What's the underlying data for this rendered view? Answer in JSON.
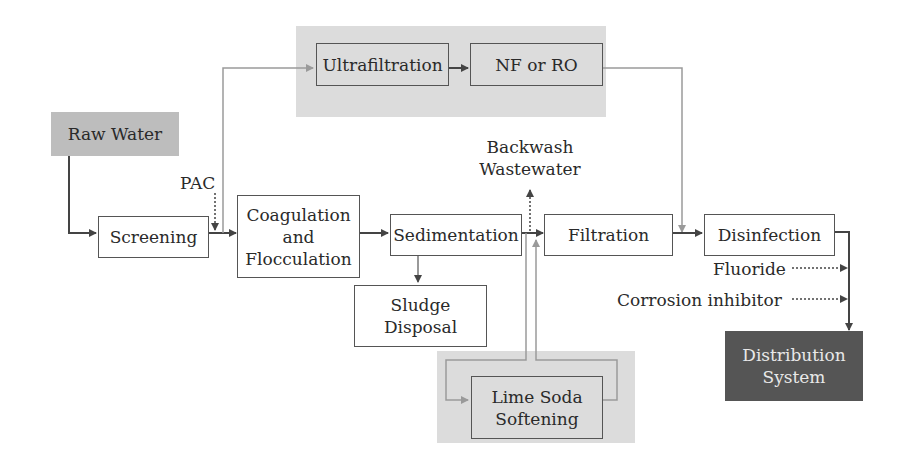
{
  "diagram": {
    "nodes": {
      "raw_water": "Raw Water",
      "screening": "Screening",
      "coagulation_line1": "Coagulation",
      "coagulation_line2": "and",
      "coagulation_line3": "Flocculation",
      "sedimentation": "Sedimentation",
      "filtration": "Filtration",
      "disinfection": "Disinfection",
      "ultrafiltration": "Ultrafiltration",
      "nf_ro": "NF or RO",
      "sludge_line1": "Sludge",
      "sludge_line2": "Disposal",
      "lime_line1": "Lime Soda",
      "lime_line2": "Softening",
      "distribution_line1": "Distribution",
      "distribution_line2": "System"
    },
    "labels": {
      "pac": "PAC",
      "backwash_line1": "Backwash",
      "backwash_line2": "Wastewater",
      "fluoride": "Fluoride",
      "corrosion": "Corrosion inhibitor"
    },
    "colors": {
      "panel": "#dcdcdc",
      "raw_water_fill": "#bdbdbd",
      "distribution_fill": "#555555",
      "main_line": "#444444",
      "bypass_line": "#9a9a9a"
    },
    "edges": [
      {
        "from": "Raw Water",
        "to": "Screening"
      },
      {
        "from": "Screening",
        "to": "Coagulation and Flocculation"
      },
      {
        "from": "PAC",
        "to": "Screening-Coagulation junction",
        "style": "dotted"
      },
      {
        "from": "Screening-Coagulation junction",
        "to": "Ultrafiltration",
        "style": "bypass"
      },
      {
        "from": "Ultrafiltration",
        "to": "NF or RO"
      },
      {
        "from": "NF or RO",
        "to": "Filtration-Disinfection junction",
        "style": "bypass"
      },
      {
        "from": "Coagulation and Flocculation",
        "to": "Sedimentation"
      },
      {
        "from": "Sedimentation",
        "to": "Sludge Disposal"
      },
      {
        "from": "Sedimentation",
        "to": "Filtration"
      },
      {
        "from": "Sedimentation-Filtration junction",
        "to": "Backwash Wastewater",
        "style": "dotted"
      },
      {
        "from": "Sedimentation-Filtration junction",
        "to": "Lime Soda Softening",
        "style": "bypass"
      },
      {
        "from": "Lime Soda Softening",
        "to": "Sedimentation-Filtration junction",
        "style": "bypass"
      },
      {
        "from": "Filtration",
        "to": "Disinfection"
      },
      {
        "from": "Fluoride",
        "to": "Distribution line",
        "style": "dotted"
      },
      {
        "from": "Corrosion inhibitor",
        "to": "Distribution line",
        "style": "dotted"
      },
      {
        "from": "Disinfection",
        "to": "Distribution System"
      }
    ]
  }
}
